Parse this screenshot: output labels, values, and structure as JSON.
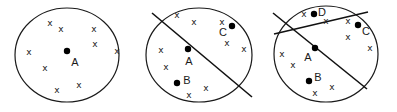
{
  "figure": {
    "cross_glyph": "x",
    "panels": [
      {
        "id": "panel-1",
        "ellipse": {
          "cx": 67,
          "cy": 55,
          "rx": 52,
          "ry": 47
        },
        "lines": [],
        "crosses": [
          [
            50,
            23
          ],
          [
            61,
            29
          ],
          [
            94,
            29
          ],
          [
            29,
            52
          ],
          [
            95,
            44
          ],
          [
            117,
            51
          ],
          [
            45,
            68
          ],
          [
            79,
            85
          ],
          [
            57,
            90
          ]
        ],
        "points": [
          {
            "name": "A",
            "x": 67,
            "y": 51,
            "lx": 75,
            "ly": 62
          }
        ]
      },
      {
        "id": "panel-2",
        "ellipse": {
          "cx": 199,
          "cy": 55,
          "rx": 53,
          "ry": 47
        },
        "lines": [
          {
            "x1": 152,
            "y1": 13,
            "x2": 252,
            "y2": 97
          }
        ],
        "crosses": [
          [
            177,
            15
          ],
          [
            194,
            22
          ],
          [
            222,
            22
          ],
          [
            161,
            50
          ],
          [
            227,
            43
          ],
          [
            244,
            49
          ],
          [
            166,
            67
          ],
          [
            189,
            95
          ],
          [
            206,
            88
          ]
        ],
        "points": [
          {
            "name": "C",
            "x": 232,
            "y": 26,
            "lx": 223,
            "ly": 32
          },
          {
            "name": "A",
            "x": 188,
            "y": 49,
            "lx": 189,
            "ly": 61
          },
          {
            "name": "B",
            "x": 177,
            "y": 83,
            "lx": 187,
            "ly": 80
          }
        ]
      },
      {
        "id": "panel-3",
        "ellipse": {
          "cx": 326,
          "cy": 54,
          "rx": 52,
          "ry": 48
        },
        "lines": [
          {
            "x1": 273,
            "y1": 13,
            "x2": 367,
            "y2": 89
          },
          {
            "x1": 274,
            "y1": 34,
            "x2": 368,
            "y2": 12
          }
        ],
        "crosses": [
          [
            304,
            14
          ],
          [
            326,
            21
          ],
          [
            348,
            21
          ],
          [
            282,
            54
          ],
          [
            293,
            65
          ],
          [
            348,
            37
          ],
          [
            370,
            48
          ],
          [
            315,
            93
          ],
          [
            332,
            87
          ]
        ],
        "points": [
          {
            "name": "D",
            "x": 314,
            "y": 14,
            "lx": 322,
            "ly": 12
          },
          {
            "name": "C",
            "x": 358,
            "y": 25,
            "lx": 366,
            "ly": 31
          },
          {
            "name": "A",
            "x": 315,
            "y": 48,
            "lx": 308,
            "ly": 57
          },
          {
            "name": "B",
            "x": 309,
            "y": 81,
            "lx": 318,
            "ly": 77
          }
        ]
      }
    ]
  }
}
